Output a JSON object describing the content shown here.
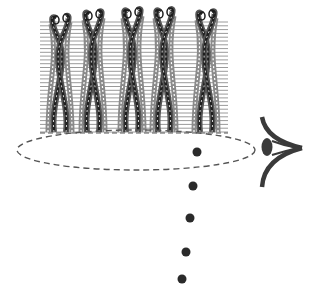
{
  "diagram": {
    "width": 312,
    "height": 304,
    "background": "#ffffff",
    "colors": {
      "grid_line": "#9a9a9a",
      "strand_dark": "#1e1e1e",
      "strand_mid": "#555555",
      "strand_outline": "#8a8a8a",
      "ellipse_dash": "#555555",
      "dot": "#2a2a2a",
      "eye": "#3a3a3a"
    },
    "fiber_bundle": {
      "x_start": 40,
      "x_end": 228,
      "y_top": 22,
      "y_bottom": 132,
      "line_count": 30,
      "strand_pairs": [
        {
          "x": 60,
          "top": 18
        },
        {
          "x": 93,
          "top": 14
        },
        {
          "x": 132,
          "top": 12
        },
        {
          "x": 164,
          "top": 12
        },
        {
          "x": 206,
          "top": 14
        }
      ]
    },
    "ellipse": {
      "cx": 136,
      "cy": 150,
      "rx": 119,
      "ry": 20
    },
    "dots": [
      {
        "x": 197,
        "y": 152,
        "r": 4.5
      },
      {
        "x": 193,
        "y": 186,
        "r": 4.5
      },
      {
        "x": 190,
        "y": 218,
        "r": 4.5
      },
      {
        "x": 186,
        "y": 252,
        "r": 4.5
      },
      {
        "x": 182,
        "y": 279,
        "r": 4.5
      }
    ],
    "eye": {
      "pupil_x": 267,
      "pupil_y": 147,
      "apex_x": 302,
      "apex_y": 148
    }
  }
}
